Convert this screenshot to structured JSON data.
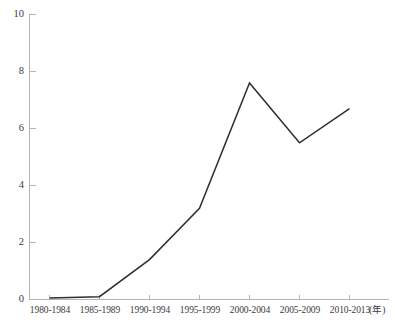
{
  "chart_data": {
    "type": "line",
    "title": "",
    "xlabel": "(年)",
    "ylabel": "",
    "categories": [
      "1980-1984",
      "1985-1989",
      "1990-1994",
      "1995-1999",
      "2000-2004",
      "2005-2009",
      "2010-2013"
    ],
    "values": [
      0.05,
      0.1,
      1.4,
      3.2,
      7.6,
      5.5,
      6.7
    ],
    "series": [
      {
        "name": "",
        "values": [
          0.05,
          0.1,
          1.4,
          3.2,
          7.6,
          5.5,
          6.7
        ]
      }
    ],
    "ylim": [
      0,
      10
    ],
    "ytick_labels": [
      "0",
      "2",
      "4",
      "6",
      "8",
      "10"
    ],
    "ytick_values": [
      0,
      2,
      4,
      6,
      8,
      10
    ],
    "grid": false,
    "legend": false,
    "legend_position": "none",
    "line_color": "#2e2e2e",
    "axis_color": "#b4b4b4"
  }
}
